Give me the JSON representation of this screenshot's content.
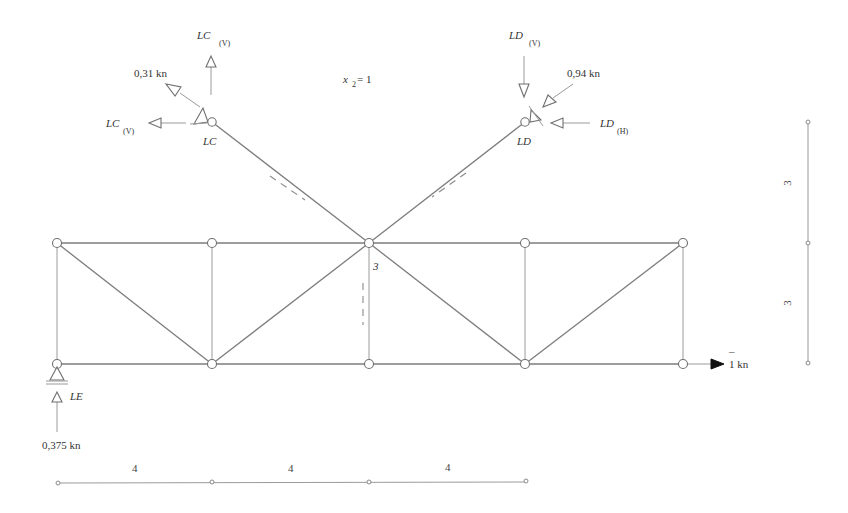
{
  "diagram": {
    "type": "truss-influence-diagram",
    "equation": {
      "var": "x",
      "sub": "2",
      "rest": " = 1"
    },
    "joint_label": "3",
    "supports": {
      "lc": {
        "name": "LC",
        "reaction_v_top": "LC",
        "reaction_v_top_sub": "(V)",
        "reaction_h": "LC",
        "reaction_h_sub": "(V)",
        "inclined_force": "0,31 kn"
      },
      "ld": {
        "name": "LD",
        "reaction_v": "LD",
        "reaction_v_sub": "(V)",
        "reaction_h": "LD",
        "reaction_h_sub": "(H)",
        "inclined_force": "0,94 kn"
      },
      "le": {
        "name": "LE",
        "reaction": "0,375 kn"
      }
    },
    "applied_load": {
      "bar": "¯",
      "value": "1 kn"
    },
    "dimensions": {
      "horizontal": [
        "4",
        "4",
        "4"
      ],
      "vertical": [
        "3",
        "3"
      ]
    },
    "colors": {
      "member": "#7d7d7d",
      "text": "#333333",
      "load_arrow": "#111111"
    }
  }
}
